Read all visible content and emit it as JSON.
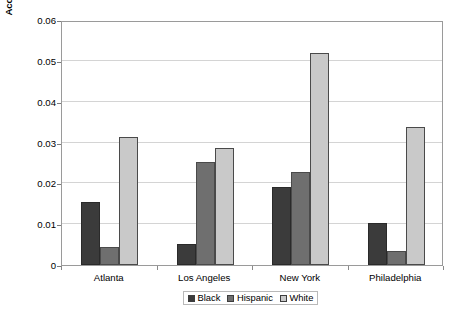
{
  "chart_data": {
    "type": "bar",
    "title": "",
    "subtitle": "",
    "xlabel": "",
    "ylabel": "Accessibility Index (weighted by size of the labor force)",
    "categories": [
      "Atlanta",
      "Los Angeles",
      "New York",
      "Philadelphia"
    ],
    "series": [
      {
        "name": "Black",
        "color": "#3b3b3b",
        "values": [
          0.0155,
          0.0052,
          0.019,
          0.0102
        ]
      },
      {
        "name": "Hispanic",
        "color": "#6f6f6f",
        "values": [
          0.0045,
          0.0253,
          0.0227,
          0.0035
        ]
      },
      {
        "name": "White",
        "color": "#c9c9c9",
        "values": [
          0.0313,
          0.0287,
          0.052,
          0.0338
        ]
      }
    ],
    "ylim": [
      0,
      0.06
    ],
    "ytick_values": [
      0,
      0.01,
      0.02,
      0.03,
      0.04,
      0.05,
      0.06
    ],
    "ytick_labels": [
      "0",
      "0.01",
      "0.02",
      "0.03",
      "0.04",
      "0.05",
      "0.06"
    ],
    "grid": true,
    "grid_axis": "y",
    "legend_position": "bottom-center",
    "plot_border_color": "#9a9a9a",
    "gridline_color": "#d4d4d4"
  },
  "bottom_caption": ""
}
